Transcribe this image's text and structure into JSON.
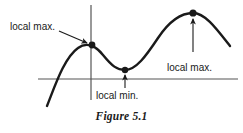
{
  "figure": {
    "caption": "Figure 5.1",
    "colors": {
      "curve": "#1a1a1a",
      "axis": "#555555",
      "text": "#1a1a1a",
      "background": "#ffffff"
    },
    "axes": {
      "x_axis": {
        "x1": 38,
        "y1": 79,
        "x2": 238,
        "y2": 79
      },
      "y_axis": {
        "x1": 91,
        "y1": 5,
        "x2": 91,
        "y2": 100
      }
    },
    "curve": {
      "path": "M 47,106 C 55,86 64,58 78,48 C 86,42 95,45 103,55 C 112,66 117,70 125,70 C 136,70 146,56 158,38 C 170,20 182,13 193,13 C 205,13 216,28 230,46",
      "description": "cubic-like curve with a local maximum, a local minimum, and a higher local maximum"
    },
    "points": [
      {
        "name": "local-max-left",
        "x": 92,
        "y": 45,
        "label": "local max."
      },
      {
        "name": "local-min",
        "x": 125,
        "y": 70,
        "label": "local min."
      },
      {
        "name": "local-max-right",
        "x": 193,
        "y": 13,
        "label": "local max."
      }
    ],
    "annotations": [
      {
        "name": "local-max-left",
        "label": "local max.",
        "label_x": 10,
        "label_y": 21,
        "arrow": {
          "x1": 59,
          "y1": 31,
          "x2": 89,
          "y2": 44
        }
      },
      {
        "name": "local-min",
        "label": "local min.",
        "label_x": 96,
        "label_y": 90,
        "arrow": {
          "x1": 125,
          "y1": 88,
          "x2": 125,
          "y2": 73
        }
      },
      {
        "name": "local-max-right",
        "label": "local max.",
        "label_x": 167,
        "label_y": 62,
        "arrow": {
          "x1": 193,
          "y1": 52,
          "x2": 193,
          "y2": 16
        }
      }
    ]
  }
}
